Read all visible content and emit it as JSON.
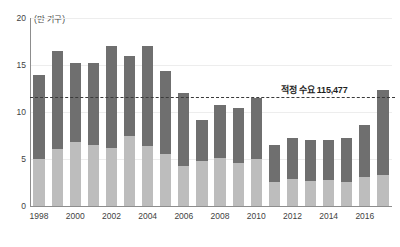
{
  "chart_data": {
    "type": "bar",
    "stacked": true,
    "title": "",
    "subtitle": "",
    "unit_label": "(만 가구)",
    "xlabel": "",
    "ylabel": "",
    "ylim": [
      0,
      20
    ],
    "y_ticks": [
      0,
      5,
      10,
      15,
      20
    ],
    "y_tick_labels": [
      "0",
      "5",
      "10",
      "15",
      "20"
    ],
    "grid": true,
    "legend_position": "none",
    "categories": [
      "1998",
      "1999",
      "2000",
      "2001",
      "2002",
      "2003",
      "2004",
      "2005",
      "2006",
      "2007",
      "2008",
      "2009",
      "2010",
      "2011",
      "2012",
      "2013",
      "2014",
      "2015",
      "2016",
      "2017"
    ],
    "x_tick_labels": [
      "1998",
      "2000",
      "2002",
      "2004",
      "2006",
      "2008",
      "2010",
      "2012",
      "2014",
      "2016"
    ],
    "series": [
      {
        "name": "하단 부문",
        "color": "#bdbdbd",
        "values": [
          5.0,
          6.1,
          6.8,
          6.5,
          6.2,
          7.4,
          6.4,
          5.5,
          4.3,
          4.8,
          5.1,
          4.6,
          5.0,
          2.6,
          2.9,
          2.7,
          2.8,
          2.6,
          3.1,
          3.3
        ]
      },
      {
        "name": "상단 부문",
        "color": "#6f6f6f",
        "values": [
          8.9,
          10.4,
          8.4,
          8.7,
          10.8,
          8.6,
          10.6,
          8.9,
          7.7,
          4.4,
          5.6,
          5.8,
          6.5,
          3.9,
          4.3,
          4.3,
          4.2,
          4.6,
          5.5,
          9.0
        ]
      }
    ],
    "totals": [
      13.9,
      16.5,
      15.2,
      15.2,
      17.0,
      16.0,
      17.0,
      14.4,
      12.0,
      9.2,
      10.7,
      10.4,
      11.5,
      6.5,
      7.2,
      7.0,
      7.0,
      7.2,
      8.6,
      12.3
    ],
    "annotations": [
      {
        "name": "reference-line",
        "label": "적정 수요 115,477",
        "value": 11.5477,
        "style": "dashed",
        "color": "#3a3a3a"
      }
    ]
  }
}
